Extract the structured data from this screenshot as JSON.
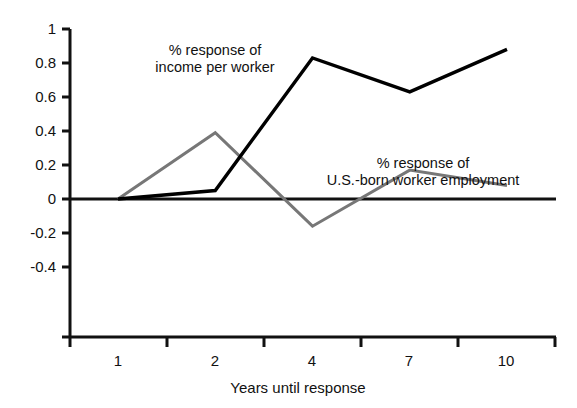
{
  "chart_data": {
    "type": "line",
    "title": "",
    "xlabel": "Years until response",
    "ylabel": "",
    "categories": [
      "1",
      "2",
      "4",
      "7",
      "10"
    ],
    "x": [
      1,
      2,
      4,
      7,
      10
    ],
    "ylim": [
      -0.4,
      1
    ],
    "yticks": [
      1,
      0.8,
      0.6,
      0.4,
      0.2,
      0,
      -0.2,
      -0.4
    ],
    "ytick_labels": [
      "1",
      "0.8",
      "0.6",
      "0.4",
      "0.2",
      "0",
      "-0.2",
      "-0.4"
    ],
    "grid": false,
    "legend_position": "inline-annotations",
    "zero_line": true,
    "series": [
      {
        "name": "% response of income per worker",
        "color": "#000000",
        "values": [
          0.0,
          0.05,
          0.83,
          0.63,
          0.88
        ]
      },
      {
        "name": "% response of U.S.-born worker employment",
        "color": "#777777",
        "values": [
          0.0,
          0.39,
          -0.16,
          0.17,
          0.08
        ]
      }
    ],
    "annotations": [
      {
        "id": "income-annotation",
        "line1": "% response of",
        "line2": "income per worker"
      },
      {
        "id": "employment-annotation",
        "line1": "% response of",
        "line2": "U.S.-born worker employment"
      }
    ]
  },
  "axes": {
    "x_axis_title": "Years until response"
  }
}
